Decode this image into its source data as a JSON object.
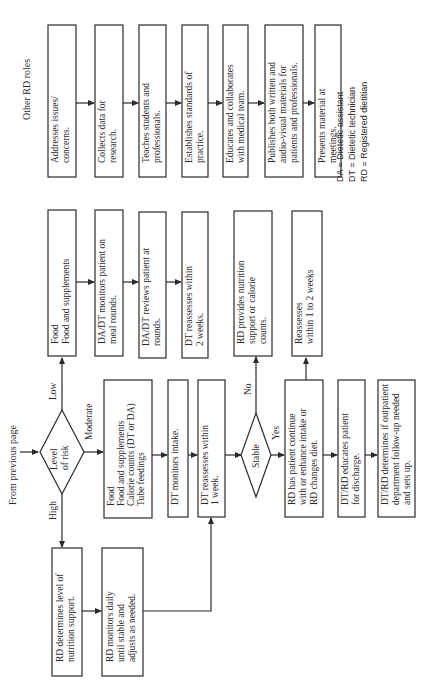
{
  "title": "Other RD roles",
  "start_label": "From previous page",
  "decision_risk": {
    "lines": [
      "Level",
      "of risk"
    ],
    "branches": {
      "high": "High",
      "moderate": "Moderate",
      "low": "Low"
    }
  },
  "decision_stable": {
    "label": "Stable",
    "branches": {
      "yes": "Yes",
      "no": "No"
    }
  },
  "other_roles": [
    {
      "lines": [
        "Addresses issues/",
        "concerns."
      ]
    },
    {
      "lines": [
        "Collects data for",
        "research."
      ]
    },
    {
      "lines": [
        "Teaches students and",
        "professionals."
      ]
    },
    {
      "lines": [
        "Establishes standards of",
        "practice."
      ]
    },
    {
      "lines": [
        "Educates and collaborates",
        "with medical team."
      ]
    },
    {
      "lines": [
        "Publishes both written and",
        "audio-visual materials for",
        "patients and professionals."
      ]
    },
    {
      "lines": [
        "Presents material at",
        "meetings."
      ]
    }
  ],
  "low_path": [
    {
      "lines": [
        "Food",
        "Food and supplements"
      ]
    },
    {
      "lines": [
        "DA/DT monitors patient on",
        "meal rounds."
      ]
    },
    {
      "lines": [
        "DA/DT reviews patient at",
        "rounds."
      ]
    },
    {
      "lines": [
        "DT reassesses within",
        "2 weeks."
      ]
    }
  ],
  "moderate_path": [
    {
      "lines": [
        "Food",
        "Food and supplements",
        "Calorie counts (DT or DA)",
        "Tube feedings"
      ]
    },
    {
      "lines": [
        "DT monitors intake."
      ]
    },
    {
      "lines": [
        "DT reassesses within",
        "1 week."
      ]
    }
  ],
  "high_path": [
    {
      "lines": [
        "RD determines level of",
        "nutrition support."
      ]
    },
    {
      "lines": [
        "RD monitors daily",
        "until stable and",
        "adjusts as needed."
      ]
    }
  ],
  "no_path": [
    {
      "lines": [
        "RD provides nutrition",
        "support or calorie",
        "counts."
      ]
    },
    {
      "lines": [
        "Reassesses",
        "within 1 to 2 weeks"
      ]
    }
  ],
  "yes_path": [
    {
      "lines": [
        "RD has patient continue",
        "with or enhance intake or",
        "RD changes diet."
      ]
    },
    {
      "lines": [
        "DT/RD educates patient",
        "for discharge."
      ]
    },
    {
      "lines": [
        "DT/RD determines if outpatient",
        "department follow-up needed",
        "and sets up."
      ]
    }
  ],
  "legend": [
    "DA = Dietetic assistant",
    "DT = Dietetic technician",
    "RD = Registered dietitian"
  ]
}
